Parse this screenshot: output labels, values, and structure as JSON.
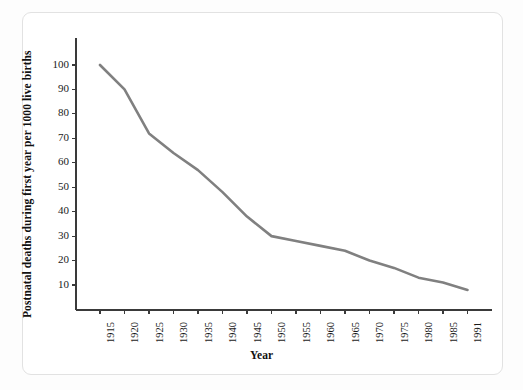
{
  "figure": {
    "background_color": "#ffffff",
    "border_color": "#e2e2e2",
    "axis_color": "#3a3a3a",
    "line_color": "#808080"
  },
  "chart_data": {
    "type": "line",
    "title": "",
    "xlabel": "Year",
    "ylabel": "Postnatal deaths during first year per 1000 live births",
    "categories": [
      "1915",
      "1920",
      "1925",
      "1930",
      "1935",
      "1940",
      "1945",
      "1950",
      "1955",
      "1960",
      "1965",
      "1970",
      "1975",
      "1980",
      "1985",
      "1991"
    ],
    "x": [
      1915,
      1920,
      1925,
      1930,
      1935,
      1940,
      1945,
      1950,
      1955,
      1960,
      1965,
      1970,
      1975,
      1980,
      1985,
      1991
    ],
    "values": [
      100,
      90,
      72,
      64,
      57,
      48,
      38,
      30,
      28,
      26,
      24,
      20,
      17,
      13,
      11,
      8
    ],
    "series": [
      {
        "name": "Postnatal deaths",
        "values": [
          100,
          90,
          72,
          64,
          57,
          48,
          38,
          30,
          28,
          26,
          24,
          20,
          17,
          13,
          11,
          8
        ],
        "color": "#808080"
      }
    ],
    "ytick_labels": [
      "10",
      "20",
      "30",
      "40",
      "50",
      "60",
      "70",
      "80",
      "90",
      "100"
    ],
    "yticks": [
      10,
      20,
      30,
      40,
      50,
      60,
      70,
      80,
      90,
      100
    ],
    "ylim": [
      0,
      110
    ],
    "xlim": [
      1913,
      1993
    ],
    "grid": false,
    "legend": false,
    "legend_position": "none",
    "annotations": []
  }
}
